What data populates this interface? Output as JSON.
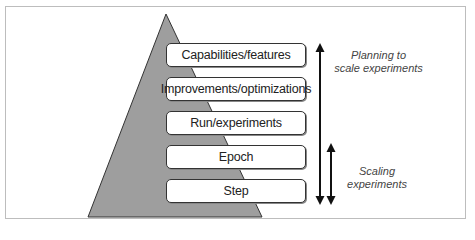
{
  "diagram": {
    "levels": [
      {
        "label": "Capabilities/features"
      },
      {
        "label": "Improvements/optimizations"
      },
      {
        "label": "Run/experiments"
      },
      {
        "label": "Epoch"
      },
      {
        "label": "Step"
      }
    ],
    "annotations": {
      "planning": {
        "line1": "Planning to",
        "line2": "scale experiments"
      },
      "scaling": {
        "line1": "Scaling",
        "line2": "experiments"
      }
    },
    "colors": {
      "pyramid_fill": "#9e9e9e",
      "pyramid_stroke": "#333333",
      "box_border": "#333333",
      "frame_border": "#bdbdbd",
      "arrow": "#111111"
    }
  }
}
